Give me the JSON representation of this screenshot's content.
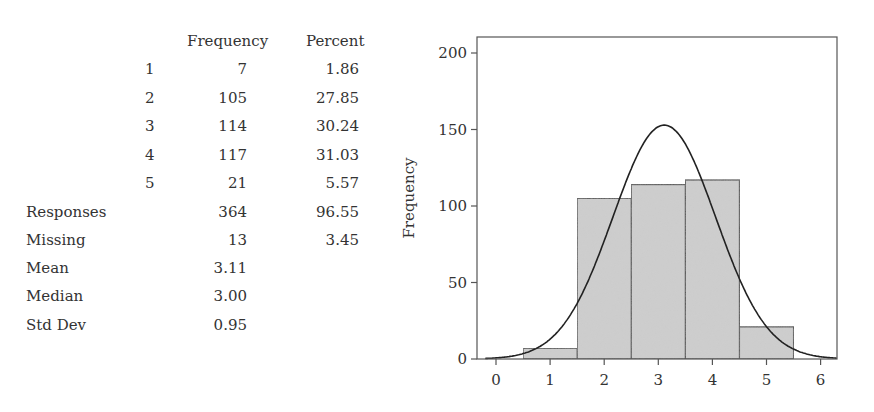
{
  "table": {
    "headers": {
      "frequency": "Frequency",
      "percent": "Percent"
    },
    "rows": [
      {
        "label": "1",
        "frequency": "7",
        "percent": "1.86"
      },
      {
        "label": "2",
        "frequency": "105",
        "percent": "27.85"
      },
      {
        "label": "3",
        "frequency": "114",
        "percent": "30.24"
      },
      {
        "label": "4",
        "frequency": "117",
        "percent": "31.03"
      },
      {
        "label": "5",
        "frequency": "21",
        "percent": "5.57"
      }
    ],
    "summary": [
      {
        "label": "Responses",
        "frequency": "364",
        "percent": "96.55"
      },
      {
        "label": "Missing",
        "frequency": "13",
        "percent": "3.45"
      },
      {
        "label": "Mean",
        "frequency": "3.11",
        "percent": ""
      },
      {
        "label": "Median",
        "frequency": "3.00",
        "percent": ""
      },
      {
        "label": "Std Dev",
        "frequency": "0.95",
        "percent": ""
      }
    ]
  },
  "chart_data": {
    "type": "bar",
    "subtype": "histogram_with_normal_curve",
    "title": "",
    "xlabel": "",
    "ylabel": "Frequency",
    "categories": [
      "1",
      "2",
      "3",
      "4",
      "5"
    ],
    "bins": [
      [
        0.5,
        1.5
      ],
      [
        1.5,
        2.5
      ],
      [
        2.5,
        3.5
      ],
      [
        3.5,
        4.5
      ],
      [
        4.5,
        5.5
      ]
    ],
    "values": [
      7,
      105,
      114,
      117,
      21
    ],
    "normal_curve": {
      "mean": 3.11,
      "sd": 0.95,
      "n": 364,
      "bin_width": 1
    },
    "xlim": [
      -0.35,
      6.3
    ],
    "ylim": [
      0,
      210
    ],
    "xticks": [
      "0",
      "1",
      "2",
      "3",
      "4",
      "5",
      "6"
    ],
    "yticks": [
      "0",
      "50",
      "100",
      "150",
      "200"
    ],
    "grid": false,
    "legend": null,
    "colors": {
      "bar_fill": "#cfcfcf",
      "bar_edge": "#444444",
      "curve": "#222222",
      "axis": "#555555"
    }
  }
}
